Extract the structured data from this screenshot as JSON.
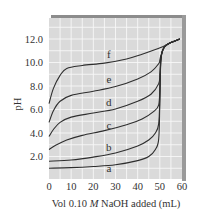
{
  "chart_data": {
    "type": "line",
    "title": "",
    "xlabel": "Vol 0.10 M NaOH added (mL)",
    "xlabel_parts": {
      "prefix": "Vol 0.10 ",
      "italic": "M",
      "suffix": " NaOH added (mL)"
    },
    "ylabel": "pH",
    "xlim": [
      0,
      60
    ],
    "ylim": [
      0,
      13.8
    ],
    "x_ticks": [
      0,
      10,
      20,
      30,
      40,
      50,
      60
    ],
    "x_tick_labels": [
      "0",
      "10",
      "20",
      "30",
      "40",
      "50",
      "60"
    ],
    "y_ticks": [
      2,
      4,
      6,
      8,
      10,
      12
    ],
    "y_tick_labels": [
      "2.0",
      "4.0",
      "6.0",
      "8.0",
      "10.0",
      "12.0"
    ],
    "grid": true,
    "legend": "none (curves labeled inline a–f)",
    "series": [
      {
        "name": "a",
        "label_pos": [
          27,
          1.0
        ],
        "points": [
          [
            0,
            1.0
          ],
          [
            10,
            1.05
          ],
          [
            20,
            1.15
          ],
          [
            30,
            1.3
          ],
          [
            40,
            1.65
          ],
          [
            45,
            2.0
          ],
          [
            48,
            2.6
          ],
          [
            49.5,
            3.5
          ],
          [
            50,
            6.5
          ],
          [
            50.5,
            10.3
          ],
          [
            52,
            11.3
          ],
          [
            55,
            11.7
          ],
          [
            59,
            12.0
          ]
        ]
      },
      {
        "name": "b",
        "label_pos": [
          27,
          2.8
        ],
        "points": [
          [
            0,
            1.6
          ],
          [
            10,
            1.7
          ],
          [
            20,
            1.95
          ],
          [
            30,
            2.3
          ],
          [
            40,
            2.9
          ],
          [
            45,
            3.4
          ],
          [
            48,
            4.0
          ],
          [
            49.5,
            4.8
          ],
          [
            50,
            7.0
          ],
          [
            50.5,
            10.3
          ],
          [
            52,
            11.3
          ],
          [
            55,
            11.7
          ],
          [
            59,
            12.0
          ]
        ]
      },
      {
        "name": "c",
        "label_pos": [
          27,
          4.7
        ],
        "points": [
          [
            0,
            2.6
          ],
          [
            3,
            2.95
          ],
          [
            8,
            3.4
          ],
          [
            15,
            3.8
          ],
          [
            25,
            4.2
          ],
          [
            35,
            4.7
          ],
          [
            42,
            5.2
          ],
          [
            47,
            5.8
          ],
          [
            49.5,
            6.4
          ],
          [
            50,
            8.0
          ],
          [
            50.5,
            10.3
          ],
          [
            52,
            11.3
          ],
          [
            55,
            11.7
          ],
          [
            59,
            12.0
          ]
        ]
      },
      {
        "name": "d",
        "label_pos": [
          27,
          6.6
        ],
        "points": [
          [
            0,
            3.7
          ],
          [
            2,
            4.3
          ],
          [
            5,
            4.9
          ],
          [
            10,
            5.35
          ],
          [
            20,
            5.7
          ],
          [
            30,
            6.05
          ],
          [
            40,
            6.7
          ],
          [
            46,
            7.3
          ],
          [
            49.5,
            8.2
          ],
          [
            50,
            9.0
          ],
          [
            50.5,
            10.4
          ],
          [
            52,
            11.3
          ],
          [
            55,
            11.7
          ],
          [
            59,
            12.0
          ]
        ]
      },
      {
        "name": "e",
        "label_pos": [
          27,
          8.6
        ],
        "points": [
          [
            0,
            4.9
          ],
          [
            2,
            5.9
          ],
          [
            5,
            6.7
          ],
          [
            10,
            7.2
          ],
          [
            20,
            7.55
          ],
          [
            30,
            7.95
          ],
          [
            40,
            8.6
          ],
          [
            46,
            9.2
          ],
          [
            49.5,
            9.9
          ],
          [
            50,
            10.2
          ],
          [
            50.5,
            10.6
          ],
          [
            52,
            11.3
          ],
          [
            55,
            11.7
          ],
          [
            59,
            12.0
          ]
        ]
      },
      {
        "name": "f",
        "label_pos": [
          27,
          10.7
        ],
        "points": [
          [
            0,
            6.5
          ],
          [
            2,
            7.8
          ],
          [
            5,
            8.9
          ],
          [
            8,
            9.5
          ],
          [
            15,
            9.75
          ],
          [
            25,
            9.95
          ],
          [
            35,
            10.3
          ],
          [
            42,
            10.7
          ],
          [
            48,
            11.1
          ],
          [
            52,
            11.4
          ],
          [
            55,
            11.7
          ],
          [
            59,
            12.0
          ]
        ]
      }
    ]
  },
  "style": {
    "plot_bg": "#dadada",
    "grid_color": "#f7f7f7",
    "shadow_color": "#8c8c8c",
    "curve_color": "#2e2e2e",
    "text_color": "#333333"
  }
}
